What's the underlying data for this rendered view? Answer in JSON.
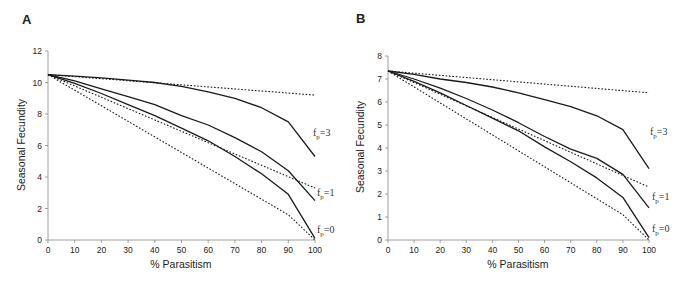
{
  "chart_data": [
    {
      "panel": "A",
      "type": "line",
      "title": "",
      "xlabel": "% Parasitism",
      "ylabel": "Seasonal Fecundity",
      "xlim": [
        0,
        100
      ],
      "ylim": [
        0,
        12
      ],
      "x_ticks": [
        0,
        10,
        20,
        30,
        40,
        50,
        60,
        70,
        80,
        90,
        100
      ],
      "y_ticks": [
        0,
        2,
        4,
        6,
        8,
        10,
        12
      ],
      "grid": false,
      "legend": "none (inline curve labels at right)",
      "series": [
        {
          "name": "f_p=3 (solid)",
          "style": "solid",
          "x": [
            0,
            10,
            20,
            30,
            40,
            50,
            60,
            70,
            80,
            90,
            100
          ],
          "values": [
            10.5,
            10.4,
            10.3,
            10.15,
            10.0,
            9.75,
            9.4,
            9.0,
            8.4,
            7.5,
            5.3
          ]
        },
        {
          "name": "f_p=3 (dotted)",
          "style": "dotted",
          "x": [
            0,
            100
          ],
          "values": [
            10.5,
            9.2
          ]
        },
        {
          "name": "f_p=1 (solid)",
          "style": "solid",
          "x": [
            0,
            10,
            20,
            30,
            40,
            50,
            60,
            70,
            80,
            90,
            100
          ],
          "values": [
            10.5,
            10.1,
            9.6,
            9.1,
            8.6,
            7.9,
            7.3,
            6.5,
            5.6,
            4.4,
            2.5
          ]
        },
        {
          "name": "f_p=1 (dotted)",
          "style": "dotted",
          "x": [
            0,
            100
          ],
          "values": [
            10.5,
            3.3
          ]
        },
        {
          "name": "f_p=0 (solid)",
          "style": "solid",
          "x": [
            0,
            10,
            20,
            30,
            40,
            50,
            60,
            70,
            80,
            90,
            100
          ],
          "values": [
            10.5,
            9.95,
            9.3,
            8.6,
            7.9,
            7.1,
            6.3,
            5.3,
            4.2,
            2.9,
            0.1
          ]
        },
        {
          "name": "f_p=0 (dotted)",
          "style": "dotted",
          "x": [
            0,
            90,
            100
          ],
          "values": [
            10.5,
            1.6,
            0.0
          ]
        }
      ],
      "annotations": [
        {
          "text": "f",
          "sub": "p",
          "rest": "=3",
          "x": 313,
          "y": 136
        },
        {
          "text": "f",
          "sub": "p",
          "rest": "=1",
          "x": 317,
          "y": 196
        },
        {
          "text": "f",
          "sub": "p",
          "rest": "=0",
          "x": 317,
          "y": 233
        }
      ]
    },
    {
      "panel": "B",
      "type": "line",
      "title": "",
      "xlabel": "% Parasitism",
      "ylabel": "Seasonal Fecundity",
      "xlim": [
        0,
        100
      ],
      "ylim": [
        0,
        8
      ],
      "x_ticks": [
        0,
        10,
        20,
        30,
        40,
        50,
        60,
        70,
        80,
        90,
        100
      ],
      "y_ticks": [
        0,
        1,
        2,
        3,
        4,
        5,
        6,
        7,
        8
      ],
      "grid": false,
      "legend": "none (inline curve labels at right)",
      "series": [
        {
          "name": "f_p=3 (solid)",
          "style": "solid",
          "x": [
            0,
            10,
            20,
            30,
            40,
            50,
            60,
            70,
            80,
            90,
            100
          ],
          "values": [
            7.35,
            7.2,
            7.0,
            6.85,
            6.65,
            6.4,
            6.1,
            5.8,
            5.4,
            4.8,
            3.1
          ]
        },
        {
          "name": "f_p=3 (dotted)",
          "style": "dotted",
          "x": [
            0,
            100
          ],
          "values": [
            7.35,
            6.4
          ]
        },
        {
          "name": "f_p=1 (solid)",
          "style": "solid",
          "x": [
            0,
            10,
            20,
            30,
            40,
            50,
            60,
            70,
            80,
            90,
            100
          ],
          "values": [
            7.35,
            7.0,
            6.6,
            6.15,
            5.65,
            5.1,
            4.5,
            3.95,
            3.55,
            2.85,
            1.4
          ]
        },
        {
          "name": "f_p=1 (dotted)",
          "style": "dotted",
          "x": [
            0,
            100
          ],
          "values": [
            7.35,
            2.3
          ]
        },
        {
          "name": "f_p=0 (solid)",
          "style": "solid",
          "x": [
            0,
            10,
            20,
            30,
            40,
            50,
            60,
            70,
            80,
            90,
            100
          ],
          "values": [
            7.35,
            6.9,
            6.4,
            5.85,
            5.3,
            4.75,
            4.05,
            3.4,
            2.7,
            1.85,
            0.1
          ]
        },
        {
          "name": "f_p=0 (dotted)",
          "style": "dotted",
          "x": [
            0,
            90,
            100
          ],
          "values": [
            7.35,
            1.1,
            0.0
          ]
        }
      ],
      "annotations": [
        {
          "text": "f",
          "sub": "p",
          "rest": "=3",
          "x": 650,
          "y": 135
        },
        {
          "text": "f",
          "sub": "p",
          "rest": "=1",
          "x": 652,
          "y": 200
        },
        {
          "text": "f",
          "sub": "p",
          "rest": "=0",
          "x": 652,
          "y": 232
        }
      ]
    }
  ],
  "panels": [
    {
      "label": "A",
      "xlabel": "% Parasitism",
      "ylabel": "Seasonal Fecundity"
    },
    {
      "label": "B",
      "xlabel": "% Parasitism",
      "ylabel": "Seasonal Fecundity"
    }
  ],
  "colors": {
    "line": "#1a1a1a",
    "axis": "#888888",
    "text": "#222222",
    "background": "#ffffff"
  }
}
